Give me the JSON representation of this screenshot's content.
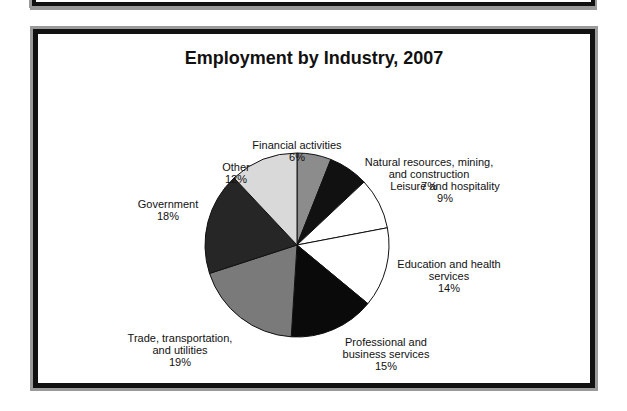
{
  "chart_data": {
    "type": "pie",
    "title": "Employment by Industry, 2007",
    "categories": [
      "Financial activities",
      "Natural resources, mining, and construction",
      "Leisure and hospitality",
      "Education and health services",
      "Professional and business services",
      "Trade, transportation, and utilities",
      "Government",
      "Other"
    ],
    "values": [
      6,
      7,
      9,
      14,
      15,
      19,
      18,
      12
    ],
    "unit": "%",
    "colors": [
      "#8c8c8c",
      "#111111",
      "#ffffff",
      "#ffffff",
      "#0a0a0a",
      "#7a7a7a",
      "#262626",
      "#d9d9d9"
    ]
  },
  "labels": {
    "financial": [
      "Financial activities",
      "6%"
    ],
    "natural": [
      "Natural resources, mining,",
      "and construction",
      "7%"
    ],
    "leisure": [
      "Leisure and hospitality",
      "9%"
    ],
    "education": [
      "Education and health",
      "services",
      "14%"
    ],
    "professional": [
      "Professional and",
      "business services",
      "15%"
    ],
    "trade": [
      "Trade, transportation,",
      "and utilities",
      "19%"
    ],
    "government": [
      "Government",
      "18%"
    ],
    "other": [
      "Other",
      "12%"
    ]
  }
}
